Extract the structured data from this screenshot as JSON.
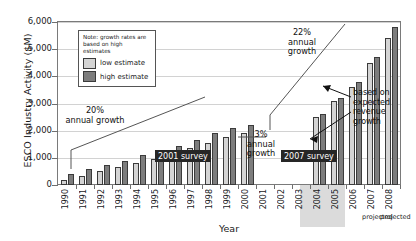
{
  "chart_data": {
    "type": "bar",
    "title": "",
    "xlabel": "Year",
    "ylabel": "ESCO Industry Activity ($M)",
    "ylim": [
      0,
      6000
    ],
    "ytick_labels": [
      "6,000",
      "5,000",
      "4,000",
      "3,000",
      "2,000",
      "1,000",
      "0"
    ],
    "ytick_values": [
      6000,
      5000,
      4000,
      3000,
      2000,
      1000,
      0
    ],
    "grid": true,
    "legend_position": "inside-top-left",
    "categories": [
      "1990",
      "1991",
      "1992",
      "1993",
      "1994",
      "1995",
      "1996",
      "1997",
      "1998",
      "1999",
      "2000",
      "2001",
      "2002",
      "2003",
      "2004",
      "2005",
      "2006",
      "2007",
      "2008"
    ],
    "series": [
      {
        "name": "low estimate",
        "color": "#d4d4d4",
        "values": [
          200,
          350,
          500,
          650,
          800,
          950,
          1150,
          1350,
          1550,
          1750,
          1900,
          null,
          null,
          null,
          2500,
          3100,
          3600,
          4500,
          5400
        ]
      },
      {
        "name": "high estimate",
        "color": "#7d7d7d",
        "values": [
          400,
          600,
          750,
          900,
          1100,
          1250,
          1450,
          1650,
          1900,
          2100,
          2200,
          null,
          null,
          null,
          2600,
          3200,
          3800,
          4700,
          5800
        ]
      }
    ],
    "projected_categories": [
      "2007",
      "2008"
    ],
    "projected_note": "projected",
    "annotations": [
      {
        "name": "growth-20",
        "text": "20%\nannual growth"
      },
      {
        "name": "growth-3",
        "text": "3%\nannual\ngrowth"
      },
      {
        "name": "growth-22",
        "text": "22%\nannual\ngrowth"
      },
      {
        "name": "expected-revenue",
        "text": "based on\nexpected\nrevenue\ngrowth"
      },
      {
        "name": "survey-2001",
        "text": "2001 survey"
      },
      {
        "name": "survey-2007",
        "text": "2007 survey"
      }
    ]
  },
  "axes": {
    "y_title": "ESCO Industry Activity ($M)",
    "x_title": "Year",
    "y_labels": [
      "6,000",
      "5,000",
      "4,000",
      "3,000",
      "2,000",
      "1,000",
      "0"
    ],
    "x_labels": [
      "1990",
      "1991",
      "1992",
      "1993",
      "1994",
      "1995",
      "1996",
      "1997",
      "1998",
      "1999",
      "2000",
      "2001",
      "2002",
      "2003",
      "2004",
      "2005",
      "2006",
      "2007",
      "2008"
    ],
    "projected_label_2007": "projected",
    "projected_label_2008": "projected"
  },
  "legend": {
    "note": "Note: growth rates are based on high estimates",
    "items": [
      {
        "label": "low estimate",
        "color": "#d4d4d4"
      },
      {
        "label": "high estimate",
        "color": "#7d7d7d"
      }
    ]
  },
  "annotations": {
    "growth20_pct": "20%",
    "growth20_sub": "annual growth",
    "growth3_pct": "3%",
    "growth3_sub1": "annual",
    "growth3_sub2": "growth",
    "growth22_pct": "22%",
    "growth22_sub1": "annual",
    "growth22_sub2": "growth",
    "expected_l1": "based on",
    "expected_l2": "expected",
    "expected_l3": "revenue",
    "expected_l4": "growth",
    "survey_2001": "2001 survey",
    "survey_2007": "2007 survey"
  }
}
